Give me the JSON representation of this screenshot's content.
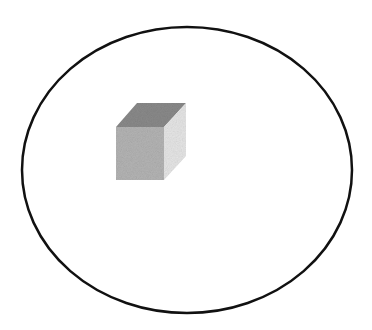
{
  "diagram": {
    "background": "#ffffff",
    "boundary": {
      "shape": "ellipse",
      "cx": 187,
      "cy": 170,
      "rx": 165,
      "ry": 143,
      "stroke": "#111111",
      "stroke_width": 2.5
    },
    "cube": {
      "label": "",
      "top_face_color": "#8a8a8a",
      "front_face_color": "#b4b4b4",
      "side_face_color": "#e6e6e6"
    }
  }
}
